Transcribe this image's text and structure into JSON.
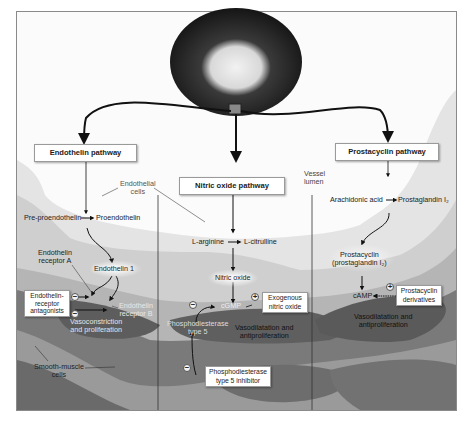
{
  "diagram": {
    "type": "biological pathway illustration",
    "colors": {
      "frame_border": "#8a8a8a",
      "background": "#fbfbfb",
      "endothelium": "#c9c9c9",
      "smooth_muscle_dark": "#6b6b6b",
      "smooth_muscle_mid": "#8f8f8f",
      "arrow": "#111111",
      "label_box": "#ffffff"
    },
    "vessel_image": {
      "label": "pulmonary-artery-cross-section"
    },
    "pathways": {
      "endothelin": {
        "title": "Endothelin pathway",
        "pre_proendothelin": "Pre-proendothelin",
        "proendothelin": "Proendothelin",
        "endothelin_1": "Endothelin 1",
        "receptor_a": "Endothelin receptor A",
        "receptor_a_line1": "Endothelin",
        "receptor_a_line2": "receptor A",
        "receptor_b_line1": "Endothelin",
        "receptor_b_line2": "receptor B",
        "antagonists_line1": "Endothelin-",
        "antagonists_line2": "receptor",
        "antagonists_line3": "antagonists",
        "effect_line1": "Vasoconstriction",
        "effect_line2": "and proliferation",
        "sign_a": "−",
        "sign_b": "−"
      },
      "nitric_oxide": {
        "title": "Nitric oxide pathway",
        "l_arginine": "L-arginine",
        "l_citrulline": "L-citrulline",
        "nitric_oxide": "Nitric oxide",
        "cgmp": "cGMP",
        "exogenous_line1": "Exogenous",
        "exogenous_line2": "nitric oxide",
        "pde5_line1": "Phosphodiesterase",
        "pde5_line2": "type 5",
        "inhibitor_line1": "Phosphodiesterase",
        "inhibitor_line2": "type 5 inhibitor",
        "effect_line1": "Vasodilatation and",
        "effect_line2": "antiproliferation",
        "sign_plus": "+",
        "sign_minus_pde": "−",
        "sign_minus_inhibitor": "−"
      },
      "prostacyclin": {
        "title": "Prostacyclin pathway",
        "arachidonic_acid": "Arachidonic acid",
        "prostaglandin_i2": "Prostaglandin I₂",
        "prostacyclin_line1": "Prostacyclin",
        "prostacyclin_line2": "(prostaglandin I₂)",
        "camp": "cAMP",
        "derivatives_line1": "Prostacyclin",
        "derivatives_line2": "derivatives",
        "effect_line1": "Vasodilatation and",
        "effect_line2": "antiproliferation",
        "sign_plus": "+"
      }
    },
    "anatomy": {
      "endothelial_line1": "Endothelial",
      "endothelial_line2": "cells",
      "vessel_line1": "Vessel",
      "vessel_line2": "lumen",
      "smooth_line1": "Smooth-muscle",
      "smooth_line2": "cells"
    }
  }
}
